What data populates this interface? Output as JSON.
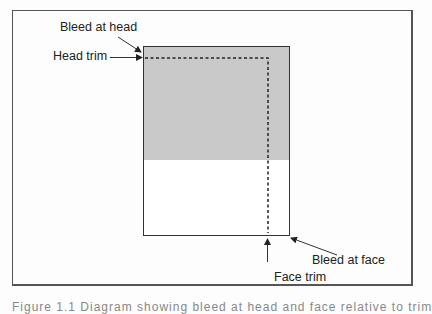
{
  "labels": {
    "bleed_at_head": "Bleed at head",
    "head_trim": "Head trim",
    "bleed_at_face": "Bleed at face",
    "face_trim": "Face trim"
  },
  "caption": "Figure 1.1  Diagram showing bleed at head and face relative to trim",
  "colors": {
    "bleed_fill": "#c9c9c9",
    "page_fill": "#ffffff",
    "stroke": "#333333"
  }
}
